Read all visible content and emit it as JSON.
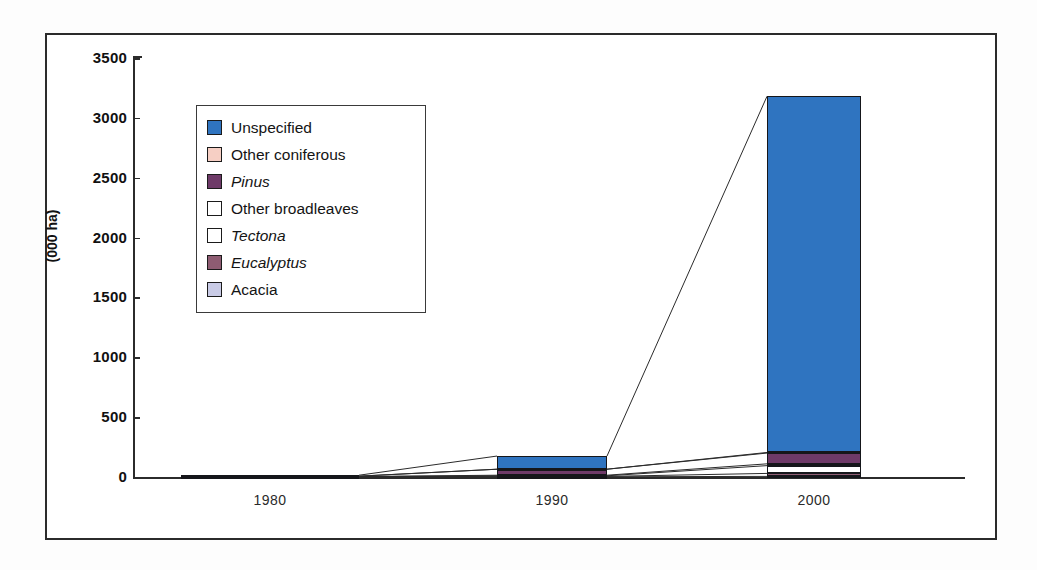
{
  "chart_data": {
    "type": "bar",
    "subtype": "stacked-bar",
    "title": "",
    "xlabel": "",
    "ylabel": "(000 ha)",
    "categories": [
      "1980",
      "1990",
      "2000"
    ],
    "ylim": [
      0,
      3500
    ],
    "yticks": [
      0,
      500,
      1000,
      1500,
      2000,
      2500,
      3000,
      3500
    ],
    "ytick_labels": [
      "0",
      "500",
      "1000",
      "1500",
      "2000",
      "2500",
      "3000",
      "3500"
    ],
    "grid": false,
    "legend_position": "inside-upper-left",
    "stack_order_bottom_to_top": [
      "Acacia",
      "Eucalyptus",
      "Tectona",
      "Other broadleaves",
      "Pinus",
      "Other coniferous",
      "Unspecified"
    ],
    "series": [
      {
        "name": "Unspecified",
        "color": "#2f74c0",
        "italic": false,
        "values": [
          8,
          110,
          2975
        ]
      },
      {
        "name": "Other coniferous",
        "color": "#f6cfc4",
        "italic": false,
        "values": [
          0,
          0,
          5
        ]
      },
      {
        "name": "Pinus",
        "color": "#6e3a68",
        "italic": true,
        "values": [
          3,
          50,
          90
        ]
      },
      {
        "name": "Other broadleaves",
        "color": "#ffffff",
        "italic": false,
        "values": [
          1,
          5,
          15
        ]
      },
      {
        "name": "Tectona",
        "color": "#ffffff",
        "italic": true,
        "values": [
          1,
          5,
          65
        ]
      },
      {
        "name": "Eucalyptus",
        "color": "#8e5c72",
        "italic": true,
        "values": [
          1,
          3,
          25
        ]
      },
      {
        "name": "Acacia",
        "color": "#c9cbe6",
        "italic": false,
        "values": [
          1,
          2,
          5
        ]
      }
    ],
    "totals": [
      15,
      175,
      3180
    ],
    "annotations": [
      "Thin connector lines join the tops of matching stack segments between adjacent year bars."
    ]
  },
  "legend": {
    "items": [
      {
        "label": "Unspecified",
        "color": "#2f74c0",
        "italic": false
      },
      {
        "label": "Other coniferous",
        "color": "#f6cfc4",
        "italic": false
      },
      {
        "label": "Pinus",
        "color": "#6e3a68",
        "italic": true
      },
      {
        "label": "Other broadleaves",
        "color": "#ffffff",
        "italic": false
      },
      {
        "label": "Tectona",
        "color": "#ffffff",
        "italic": true
      },
      {
        "label": "Eucalyptus",
        "color": "#8e5c72",
        "italic": true
      },
      {
        "label": "Acacia",
        "color": "#c9cbe6",
        "italic": false
      }
    ]
  },
  "axes": {
    "y_title": "(000 ha)",
    "y_tick_labels": [
      "3500",
      "3000",
      "2500",
      "2000",
      "1500",
      "1000",
      "500",
      "0"
    ],
    "x_tick_labels": [
      "1980",
      "1990",
      "2000"
    ]
  },
  "colors": {
    "axis": "#2b2b2b",
    "frame": "#2b2b2b",
    "background": "#ffffff",
    "unspecified": "#2f74c0",
    "other_coniferous": "#f6cfc4",
    "pinus": "#6e3a68",
    "other_broadleaves": "#ffffff",
    "tectona": "#ffffff",
    "eucalyptus": "#8e5c72",
    "acacia": "#c9cbe6"
  }
}
